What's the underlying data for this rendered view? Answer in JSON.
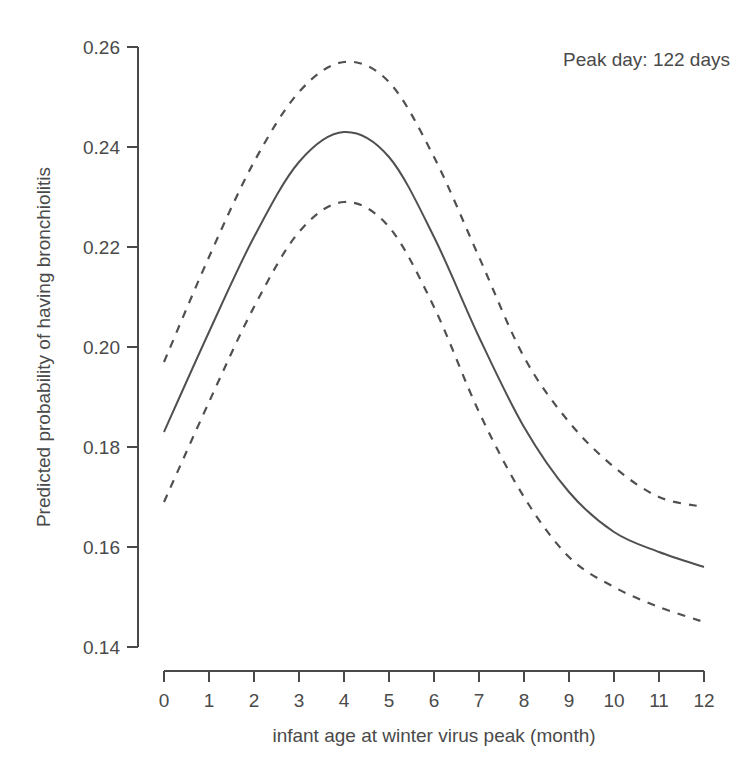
{
  "chart_data": {
    "type": "line",
    "title": "",
    "annotation": "Peak day: 122 days",
    "xlabel": "infant age at winter virus peak (month)",
    "ylabel": "Predicted probability of having bronchiolitis",
    "xlim": [
      0,
      12
    ],
    "ylim": [
      0.14,
      0.26
    ],
    "x_ticks": [
      0,
      1,
      2,
      3,
      4,
      5,
      6,
      7,
      8,
      9,
      10,
      11,
      12
    ],
    "x_tick_labels": [
      "0",
      "1",
      "2",
      "3",
      "4",
      "5",
      "6",
      "7",
      "8",
      "9",
      "10",
      "11",
      "12"
    ],
    "y_ticks": [
      0.14,
      0.16,
      0.18,
      0.2,
      0.22,
      0.24,
      0.26
    ],
    "y_tick_labels": [
      "0.14",
      "0.16",
      "0.18",
      "0.20",
      "0.22",
      "0.24",
      "0.26"
    ],
    "grid": false,
    "legend": null,
    "x": [
      0,
      1,
      2,
      3,
      4,
      5,
      6,
      7,
      8,
      9,
      10,
      11,
      12
    ],
    "series": [
      {
        "name": "Predicted probability",
        "style": "solid",
        "values": [
          0.183,
          0.203,
          0.222,
          0.237,
          0.243,
          0.238,
          0.222,
          0.202,
          0.184,
          0.171,
          0.163,
          0.159,
          0.156
        ]
      },
      {
        "name": "Upper 95% CI",
        "style": "dashed",
        "values": [
          0.197,
          0.218,
          0.237,
          0.251,
          0.257,
          0.253,
          0.238,
          0.218,
          0.198,
          0.185,
          0.176,
          0.17,
          0.168
        ]
      },
      {
        "name": "Lower 95% CI",
        "style": "dashed",
        "values": [
          0.169,
          0.189,
          0.208,
          0.223,
          0.229,
          0.224,
          0.208,
          0.187,
          0.17,
          0.158,
          0.152,
          0.148,
          0.145
        ]
      }
    ],
    "colors": {
      "line": "#505050",
      "axis": "#4a4a4a",
      "text": "#4a4a4a",
      "background": "#ffffff"
    }
  }
}
